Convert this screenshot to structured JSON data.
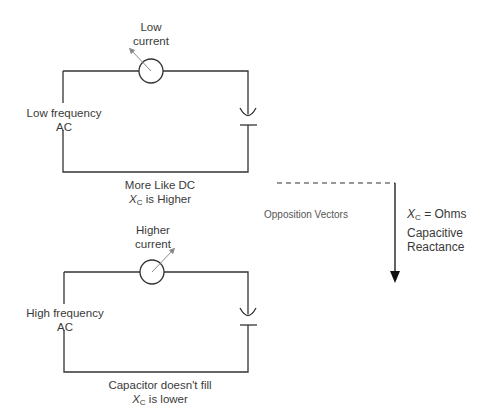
{
  "top_circuit": {
    "meter_label_line1": "Low",
    "meter_label_line2": "current",
    "source_label_line1": "Low frequency",
    "source_label_line2": "AC",
    "caption_line1": "More Like DC",
    "caption_symbol": "X",
    "caption_subscript": "C",
    "caption_line2_rest": " is Higher"
  },
  "bottom_circuit": {
    "meter_label_line1": "Higher",
    "meter_label_line2": "current",
    "source_label_line1": "High frequency",
    "source_label_line2": "AC",
    "caption_line1": "Capacitor doesn't fill",
    "caption_symbol": "X",
    "caption_subscript": "C",
    "caption_line2_rest": " is lower"
  },
  "vector": {
    "label": "Opposition Vectors",
    "symbol": "X",
    "subscript": "C",
    "equation_rest": " = Ohms",
    "desc_line1": "Capacitive",
    "desc_line2": "Reactance"
  },
  "colors": {
    "line": "#333333",
    "needle": "#888888"
  }
}
